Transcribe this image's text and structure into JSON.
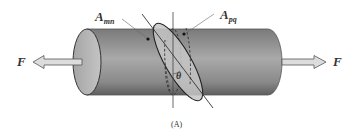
{
  "figure": {
    "caption": "(A)",
    "labels": {
      "force_left": "F",
      "force_right": "F",
      "normal_section": "A",
      "normal_section_sub": "mn",
      "inclined_section": "A",
      "inclined_section_sub": "pq",
      "angle": "θ"
    },
    "colors": {
      "bar_dark": "#6e6e6e",
      "bar_light": "#bdbdbd",
      "end_cap": "#b5b5b5",
      "section_fill": "#c8c8c8",
      "arrow_fill": "#d9d9d9",
      "line": "#333333"
    }
  }
}
